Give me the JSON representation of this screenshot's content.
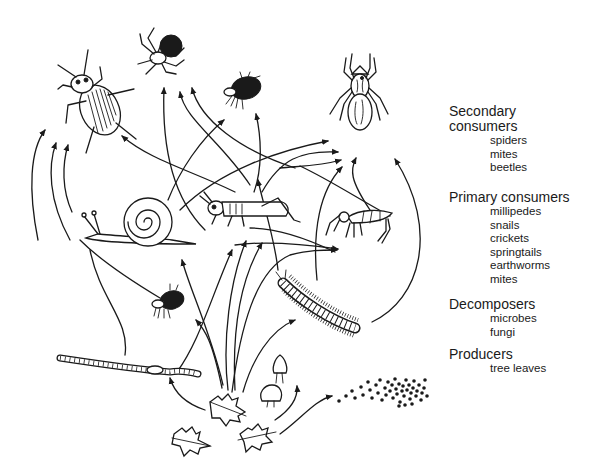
{
  "diagram": {
    "type": "soil food web illustration",
    "organisms": [
      {
        "id": "beetle",
        "level": "secondary"
      },
      {
        "id": "spider-small",
        "level": "secondary"
      },
      {
        "id": "mite-top",
        "level": "secondary"
      },
      {
        "id": "spider-large",
        "level": "secondary"
      },
      {
        "id": "snail",
        "level": "primary"
      },
      {
        "id": "cricket",
        "level": "primary"
      },
      {
        "id": "springtail",
        "level": "primary"
      },
      {
        "id": "mite-middle",
        "level": "primary"
      },
      {
        "id": "millipede",
        "level": "primary"
      },
      {
        "id": "earthworm",
        "level": "primary"
      },
      {
        "id": "mushroom",
        "level": "decomposer"
      },
      {
        "id": "microbes",
        "level": "decomposer"
      },
      {
        "id": "leaves",
        "level": "producer"
      }
    ]
  },
  "legend": {
    "secondary": {
      "heading_line1": "Secondary",
      "heading_line2": "consumers",
      "items": [
        "spiders",
        "mites",
        "beetles"
      ]
    },
    "primary": {
      "heading": "Primary consumers",
      "items": [
        "millipedes",
        "snails",
        "crickets",
        "springtails",
        "earthworms",
        "mites"
      ]
    },
    "decomposers": {
      "heading": "Decomposers",
      "items": [
        "microbes",
        "fungi"
      ]
    },
    "producers": {
      "heading": "Producers",
      "items": [
        "tree leaves"
      ]
    }
  }
}
